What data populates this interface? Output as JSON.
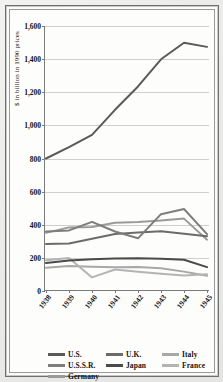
{
  "chart_data": {
    "type": "line",
    "title": "",
    "xlabel": "",
    "ylabel": "$ in billion in 1990 prices",
    "x": [
      "1938",
      "1939",
      "1940",
      "1941",
      "1942",
      "1943",
      "1944",
      "1945"
    ],
    "ylim": [
      0,
      1600
    ],
    "ytick_labels": [
      "0",
      "200",
      "400",
      "600",
      "800",
      "1,000",
      "1,200",
      "1,400",
      "1,600"
    ],
    "ytick_values": [
      0,
      200,
      400,
      600,
      800,
      1000,
      1200,
      1400,
      1600
    ],
    "grid": true,
    "legend_position": "below-axis",
    "series": [
      {
        "name": "U.S.",
        "color": "#5a5a5a",
        "values": [
          800,
          869,
          943,
          1094,
          1235,
          1399,
          1499,
          1474
        ]
      },
      {
        "name": "U.K.",
        "color": "#6b6b6b",
        "values": [
          284,
          287,
          316,
          344,
          353,
          361,
          346,
          331
        ]
      },
      {
        "name": "Italy",
        "color": "#a8a8a8",
        "values": [
          141,
          151,
          147,
          144,
          145,
          137,
          117,
          92
        ]
      },
      {
        "name": "U.S.S.R.",
        "color": "#7d7d7d",
        "values": [
          359,
          366,
          417,
          359,
          318,
          464,
          495,
          343
        ]
      },
      {
        "name": "Japan",
        "color": "#4a4a4a",
        "values": [
          169,
          184,
          192,
          196,
          197,
          194,
          189,
          144
        ]
      },
      {
        "name": "France",
        "color": "#b4b4b4",
        "values": [
          186,
          199,
          82,
          130,
          116,
          104,
          93,
          101
        ]
      },
      {
        "name": "Germany",
        "color": "#9a9a9a",
        "values": [
          351,
          384,
          387,
          412,
          417,
          426,
          437,
          310
        ]
      }
    ]
  },
  "legend": {
    "entries": [
      {
        "label": "U.S.",
        "swatch": "#5a5a5a"
      },
      {
        "label": "U.K.",
        "swatch": "#6b6b6b"
      },
      {
        "label": "Italy",
        "swatch": "#a8a8a8"
      },
      {
        "label": "U.S.S.R.",
        "swatch": "#7d7d7d"
      },
      {
        "label": "Japan",
        "swatch": "#4a4a4a"
      },
      {
        "label": "France",
        "swatch": "#b4b4b4"
      },
      {
        "label": "Germany",
        "swatch": "#9a9a9a"
      }
    ]
  }
}
